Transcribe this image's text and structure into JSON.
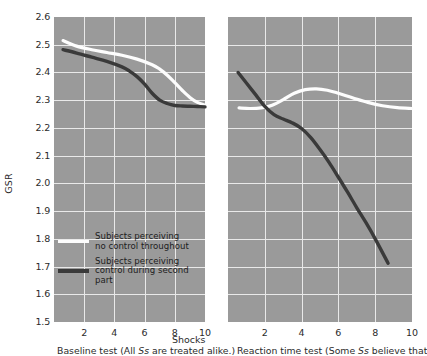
{
  "chart_data": {
    "type": "line",
    "title": "",
    "ylabel": "GSR",
    "xlabel": "Shocks",
    "ylim": [
      1.5,
      2.6
    ],
    "xlim": [
      0,
      10
    ],
    "grid": true,
    "legend_position": "lower-left-panel-1",
    "y_ticks": [
      "2.6",
      "2.5",
      "2.4",
      "2.3",
      "2.2",
      "2.1",
      "2.0",
      "1.9",
      "1.8",
      "1.7",
      "1.6",
      "1.5"
    ],
    "x_ticks": [
      "2",
      "4",
      "6",
      "8",
      "10"
    ],
    "legend": [
      {
        "label": "Subjects perceiving\nno control throughout",
        "color": "#fdfdfd"
      },
      {
        "label": "Subjects perceiving\ncontrol during second part",
        "color": "#3a3a3a"
      }
    ],
    "panels": [
      {
        "name": "baseline-test",
        "caption_prefix": "Baseline test (All ",
        "caption_italic": "Ss",
        "caption_suffix": " are treated alike.)",
        "xlim": [
          0,
          10
        ],
        "series": [
          {
            "name": "Subjects perceiving no control throughout",
            "color": "#fdfdfd",
            "x": [
              0.6,
              1.5,
              2.5,
              3.5,
              4.5,
              5.5,
              6.5,
              7.0,
              7.5,
              8.0,
              8.5,
              9.0,
              9.5,
              10.0
            ],
            "y": [
              2.515,
              2.495,
              2.482,
              2.472,
              2.462,
              2.448,
              2.428,
              2.412,
              2.39,
              2.363,
              2.335,
              2.31,
              2.292,
              2.282
            ]
          },
          {
            "name": "Subjects perceiving control during second part",
            "color": "#3a3a3a",
            "x": [
              0.6,
              1.5,
              2.5,
              3.5,
              4.5,
              5.0,
              5.5,
              6.0,
              6.5,
              7.0,
              7.5,
              8.0,
              8.5,
              9.0,
              9.5,
              10.0
            ],
            "y": [
              2.482,
              2.47,
              2.455,
              2.44,
              2.42,
              2.405,
              2.385,
              2.358,
              2.325,
              2.3,
              2.288,
              2.281,
              2.279,
              2.278,
              2.277,
              2.276
            ]
          }
        ]
      },
      {
        "name": "reaction-time-test",
        "caption_prefix": "Reaction time test (Some ",
        "caption_italic": "Ss",
        "caption_suffix": " believe that",
        "xlim": [
          0,
          10
        ],
        "series": [
          {
            "name": "Subjects perceiving no control throughout",
            "color": "#fdfdfd",
            "x": [
              0.6,
              1.2,
              1.8,
              2.4,
              3.0,
              3.6,
              4.2,
              4.8,
              5.4,
              6.0,
              6.8,
              7.6,
              8.4,
              9.2,
              10.0
            ],
            "y": [
              2.272,
              2.27,
              2.272,
              2.282,
              2.302,
              2.325,
              2.338,
              2.341,
              2.336,
              2.325,
              2.308,
              2.292,
              2.28,
              2.273,
              2.27
            ]
          },
          {
            "name": "Subjects perceiving control during second part",
            "color": "#3a3a3a",
            "x": [
              0.55,
              1.0,
              1.5,
              2.0,
              2.5,
              3.0,
              3.5,
              4.0,
              4.5,
              5.0,
              5.5,
              6.0,
              6.5,
              7.0,
              7.5,
              8.0,
              8.7
            ],
            "y": [
              2.4,
              2.362,
              2.32,
              2.278,
              2.248,
              2.232,
              2.218,
              2.198,
              2.165,
              2.122,
              2.075,
              2.022,
              1.968,
              1.912,
              1.858,
              1.8,
              1.712
            ]
          }
        ]
      }
    ]
  }
}
